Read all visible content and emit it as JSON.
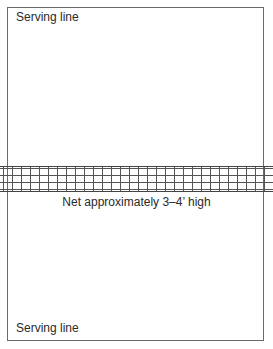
{
  "diagram": {
    "top_label": "Serving line",
    "net_label": "Net approximately 3–4’ high",
    "bottom_label": "Serving line",
    "colors": {
      "border": "#6a6a6a",
      "net_lines": "#555555",
      "text": "#2a2a2a",
      "background": "#ffffff"
    }
  }
}
